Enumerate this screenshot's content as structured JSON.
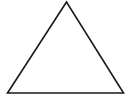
{
  "diagram": {
    "shape": "triangle",
    "stroke_color": "#1a1a1a",
    "fill_color": "#ffffff",
    "background": "#ffffff"
  }
}
